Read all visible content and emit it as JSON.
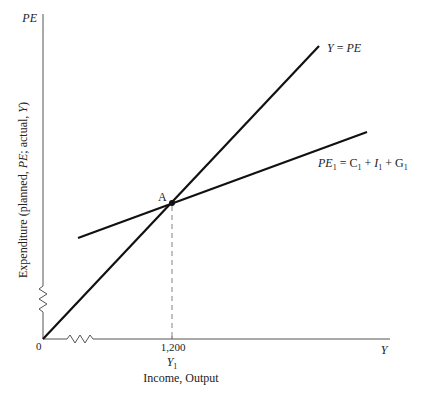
{
  "diagram": {
    "y_axis": {
      "symbol": "PE",
      "label": "Expenditure (planned, PE; actual, Y)",
      "label_parts": [
        "Expenditure (planned, ",
        "PE",
        "; actual, ",
        "Y",
        ")"
      ]
    },
    "x_axis": {
      "symbol": "Y",
      "label": "Income, Output",
      "origin_label": "0",
      "tick_value": "1,200",
      "tick_symbol": "Y",
      "tick_symbol_sub": "1"
    },
    "lines": [
      {
        "name": "45-degree-line",
        "label": "Y = PE",
        "label_parts": [
          "Y",
          " = ",
          "PE"
        ]
      },
      {
        "name": "planned-expenditure-line",
        "label": "PE1 = C1 + I1 + G1",
        "label_parts": [
          "PE",
          "1",
          " = C",
          "1",
          " + ",
          "I",
          "1",
          " + G",
          "1"
        ]
      }
    ],
    "point": {
      "label": "A"
    },
    "colors": {
      "line": "#111111",
      "axis": "#555555",
      "dashed": "#999999",
      "text": "#222222"
    }
  }
}
